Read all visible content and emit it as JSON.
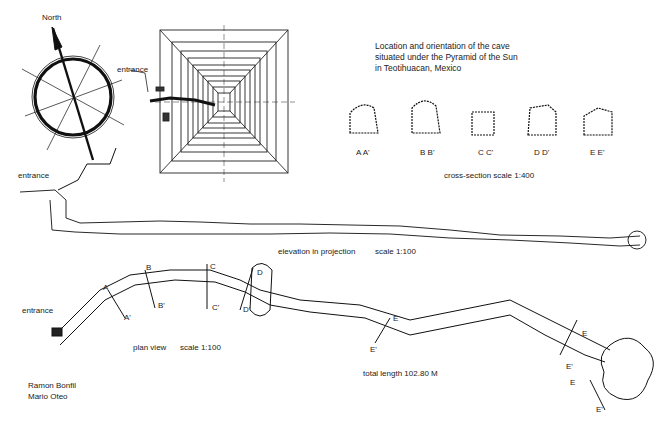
{
  "title": {
    "lines": [
      "Location and orientation of the cave",
      "situated under the Pyramid of the Sun",
      "in Teotihuacan, Mexico"
    ]
  },
  "compass": {
    "label": "North"
  },
  "pyramid_plan": {
    "entrance_label": "entrance"
  },
  "cross_sections": {
    "items": [
      {
        "label": "A A'"
      },
      {
        "label": "B B'"
      },
      {
        "label": "C C'"
      },
      {
        "label": "D D'"
      },
      {
        "label": "E E'"
      }
    ],
    "scale_label": "cross-section scale 1:400"
  },
  "elevation": {
    "entrance_label": "entrance",
    "caption": "elevation in projection",
    "scale": "scale 1:100"
  },
  "plan": {
    "entrance_label": "entrance",
    "caption": "plan view",
    "scale": "scale 1:100",
    "section_markers": [
      "A",
      "A'",
      "B",
      "B'",
      "C",
      "C'",
      "D",
      "D'",
      "E",
      "E'",
      "E",
      "E'",
      "E",
      "E'"
    ],
    "total_length": "total length  102.80 M"
  },
  "authors": [
    "Ramon Bonfil",
    "Mario Oteo"
  ]
}
